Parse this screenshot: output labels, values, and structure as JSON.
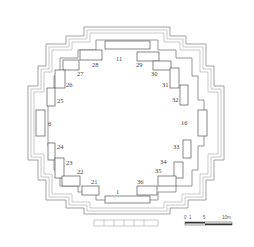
{
  "diagram": {
    "type": "architectural-floor-plan",
    "rooms": [
      {
        "id": "11",
        "label": "11"
      },
      {
        "id": "28",
        "label": "28"
      },
      {
        "id": "29",
        "label": "29"
      },
      {
        "id": "27",
        "label": "27"
      },
      {
        "id": "30",
        "label": "30"
      },
      {
        "id": "26",
        "label": "26"
      },
      {
        "id": "31",
        "label": "31"
      },
      {
        "id": "25",
        "label": "25"
      },
      {
        "id": "32",
        "label": "32"
      },
      {
        "id": "6",
        "label": "6"
      },
      {
        "id": "16",
        "label": "16"
      },
      {
        "id": "24",
        "label": "24"
      },
      {
        "id": "33",
        "label": "33"
      },
      {
        "id": "23",
        "label": "23"
      },
      {
        "id": "34",
        "label": "34"
      },
      {
        "id": "22",
        "label": "22"
      },
      {
        "id": "35",
        "label": "35"
      },
      {
        "id": "21",
        "label": "21"
      },
      {
        "id": "36",
        "label": "36"
      },
      {
        "id": "1",
        "label": "1"
      }
    ],
    "scale_bar": {
      "ticks": [
        "0",
        "1",
        "5",
        "10m"
      ],
      "label": "0 1     5      10m"
    },
    "colors": {
      "line": "#555555",
      "outer_wall": "#8a8a8a",
      "background": "#ffffff"
    }
  }
}
